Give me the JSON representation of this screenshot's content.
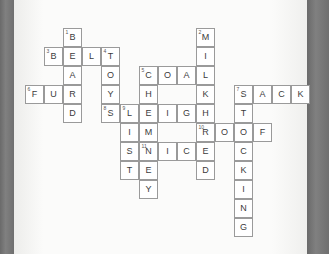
{
  "document": {
    "type": "crossword-puzzle",
    "page_background": "#fbfbfa",
    "edge_band_color": "#6e6e6e",
    "cell_border_color": "#9a9a9a",
    "cell_fill_color": "#ffffff",
    "letter_color": "#3c3c3c",
    "number_color": "#555555",
    "cell_size_px": 19
  },
  "grid": {
    "origin_x": 25,
    "origin_y": 28,
    "cols": 15,
    "rows": 11,
    "cells": [
      {
        "col": 2,
        "row": 0,
        "letter": "B",
        "number": "1"
      },
      {
        "col": 9,
        "row": 0,
        "letter": "M",
        "number": "2"
      },
      {
        "col": 1,
        "row": 1,
        "letter": "B",
        "number": "3"
      },
      {
        "col": 2,
        "row": 1,
        "letter": "E",
        "number": ""
      },
      {
        "col": 3,
        "row": 1,
        "letter": "L",
        "number": ""
      },
      {
        "col": 4,
        "row": 1,
        "letter": "T",
        "number": "4"
      },
      {
        "col": 9,
        "row": 1,
        "letter": "I",
        "number": ""
      },
      {
        "col": 2,
        "row": 2,
        "letter": "A",
        "number": ""
      },
      {
        "col": 4,
        "row": 2,
        "letter": "O",
        "number": ""
      },
      {
        "col": 6,
        "row": 2,
        "letter": "C",
        "number": "5"
      },
      {
        "col": 7,
        "row": 2,
        "letter": "O",
        "number": ""
      },
      {
        "col": 8,
        "row": 2,
        "letter": "A",
        "number": ""
      },
      {
        "col": 9,
        "row": 2,
        "letter": "L",
        "number": ""
      },
      {
        "col": 0,
        "row": 3,
        "letter": "F",
        "number": "6"
      },
      {
        "col": 1,
        "row": 3,
        "letter": "U",
        "number": ""
      },
      {
        "col": 2,
        "row": 3,
        "letter": "R",
        "number": ""
      },
      {
        "col": 4,
        "row": 3,
        "letter": "Y",
        "number": ""
      },
      {
        "col": 6,
        "row": 3,
        "letter": "H",
        "number": ""
      },
      {
        "col": 9,
        "row": 3,
        "letter": "K",
        "number": ""
      },
      {
        "col": 11,
        "row": 3,
        "letter": "S",
        "number": "7"
      },
      {
        "col": 12,
        "row": 3,
        "letter": "A",
        "number": ""
      },
      {
        "col": 13,
        "row": 3,
        "letter": "C",
        "number": ""
      },
      {
        "col": 14,
        "row": 3,
        "letter": "K",
        "number": ""
      },
      {
        "col": 2,
        "row": 4,
        "letter": "D",
        "number": ""
      },
      {
        "col": 4,
        "row": 4,
        "letter": "S",
        "number": "8"
      },
      {
        "col": 5,
        "row": 4,
        "letter": "L",
        "number": "9"
      },
      {
        "col": 6,
        "row": 4,
        "letter": "E",
        "number": ""
      },
      {
        "col": 7,
        "row": 4,
        "letter": "I",
        "number": ""
      },
      {
        "col": 8,
        "row": 4,
        "letter": "G",
        "number": ""
      },
      {
        "col": 9,
        "row": 4,
        "letter": "H",
        "number": ""
      },
      {
        "col": 11,
        "row": 4,
        "letter": "T",
        "number": ""
      },
      {
        "col": 5,
        "row": 5,
        "letter": "I",
        "number": ""
      },
      {
        "col": 6,
        "row": 5,
        "letter": "M",
        "number": ""
      },
      {
        "col": 9,
        "row": 5,
        "letter": "R",
        "number": "10"
      },
      {
        "col": 10,
        "row": 5,
        "letter": "O",
        "number": ""
      },
      {
        "col": 11,
        "row": 5,
        "letter": "O",
        "number": ""
      },
      {
        "col": 12,
        "row": 5,
        "letter": "F",
        "number": ""
      },
      {
        "col": 5,
        "row": 6,
        "letter": "S",
        "number": ""
      },
      {
        "col": 6,
        "row": 6,
        "letter": "N",
        "number": "11"
      },
      {
        "col": 7,
        "row": 6,
        "letter": "I",
        "number": ""
      },
      {
        "col": 8,
        "row": 6,
        "letter": "C",
        "number": ""
      },
      {
        "col": 9,
        "row": 6,
        "letter": "E",
        "number": ""
      },
      {
        "col": 11,
        "row": 6,
        "letter": "C",
        "number": ""
      },
      {
        "col": 5,
        "row": 7,
        "letter": "T",
        "number": ""
      },
      {
        "col": 6,
        "row": 7,
        "letter": "E",
        "number": ""
      },
      {
        "col": 9,
        "row": 7,
        "letter": "D",
        "number": ""
      },
      {
        "col": 11,
        "row": 7,
        "letter": "K",
        "number": ""
      },
      {
        "col": 6,
        "row": 8,
        "letter": "Y",
        "number": ""
      },
      {
        "col": 11,
        "row": 8,
        "letter": "I",
        "number": ""
      },
      {
        "col": 11,
        "row": 9,
        "letter": "N",
        "number": ""
      },
      {
        "col": 11,
        "row": 10,
        "letter": "G",
        "number": ""
      }
    ]
  },
  "answers": {
    "across": [
      {
        "number": "3",
        "word": "BELT"
      },
      {
        "number": "5",
        "word": "COAL"
      },
      {
        "number": "6",
        "word": "FUR"
      },
      {
        "number": "7",
        "word": "SACK"
      },
      {
        "number": "9",
        "word": "SLEIGH"
      },
      {
        "number": "10",
        "word": "ROOF"
      },
      {
        "number": "11",
        "word": "NICE"
      }
    ],
    "down": [
      {
        "number": "1",
        "word": "BEARD"
      },
      {
        "number": "2",
        "word": "MILK"
      },
      {
        "number": "4",
        "word": "TOYS"
      },
      {
        "number": "5",
        "word": "CHIMNEY"
      },
      {
        "number": "7",
        "word": "STOCKING"
      },
      {
        "number": "9",
        "word": "LIST"
      },
      {
        "number": "10",
        "word": "RED"
      }
    ]
  }
}
